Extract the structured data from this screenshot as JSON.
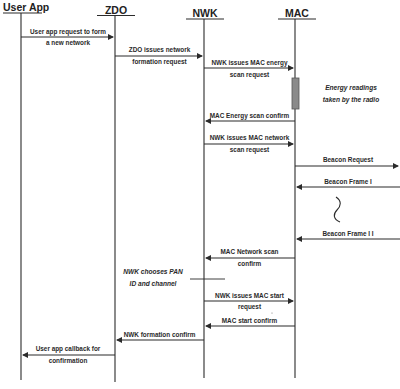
{
  "diagram": {
    "type": "sequence",
    "actors": [
      {
        "id": "user_app",
        "label": "User App"
      },
      {
        "id": "zdo",
        "label": "ZDO"
      },
      {
        "id": "nwk",
        "label": "NWK"
      },
      {
        "id": "mac",
        "label": "MAC"
      }
    ],
    "messages": [
      {
        "from": "user_app",
        "to": "zdo",
        "line1": "User app request to form",
        "line2": "a new network"
      },
      {
        "from": "zdo",
        "to": "nwk",
        "line1": "ZDO issues network",
        "line2": "formation request"
      },
      {
        "from": "nwk",
        "to": "mac",
        "line1": "NWK issues MAC energy",
        "line2": "scan request"
      },
      {
        "from": "mac",
        "to": "nwk",
        "line1": "MAC Energy scan confirm",
        "line2": ""
      },
      {
        "from": "nwk",
        "to": "mac",
        "line1": "NWK issues MAC network",
        "line2": "scan request"
      },
      {
        "from": "mac",
        "to": "external",
        "line1": "Beacon Request",
        "line2": ""
      },
      {
        "from": "external",
        "to": "mac",
        "line1": "Beacon Frame I",
        "line2": ""
      },
      {
        "from": "external",
        "to": "mac",
        "line1": "Beacon Frame I I",
        "line2": ""
      },
      {
        "from": "mac",
        "to": "nwk",
        "line1": "MAC Network scan",
        "line2": "confirm"
      },
      {
        "from": "nwk",
        "to": "mac",
        "line1": "NWK issues MAC start",
        "line2": "request"
      },
      {
        "from": "mac",
        "to": "nwk",
        "line1": "MAC start confirm",
        "line2": ""
      },
      {
        "from": "nwk",
        "to": "zdo",
        "line1": "NWK formation confirm",
        "line2": ""
      },
      {
        "from": "zdo",
        "to": "user_app",
        "line1": "User app callback for",
        "line2": "confirmation"
      }
    ],
    "notes": [
      {
        "attached_to": "mac",
        "line1": "Energy readings",
        "line2": "taken by the radio"
      },
      {
        "attached_to": "nwk",
        "line1": "NWK chooses PAN",
        "line2": "ID and channel"
      }
    ],
    "colors": {
      "line": "#2b2b2b",
      "activation_bar": "#8a8a8a",
      "activation_border": "#555555",
      "text": "#2a2a2a"
    }
  }
}
